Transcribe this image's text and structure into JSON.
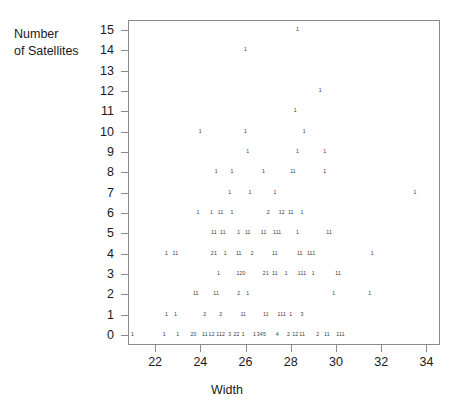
{
  "figure": {
    "background": "#ffffff",
    "frame_color": "#8c8c8c",
    "text_color": "#1a1a1a",
    "mark_color": "#3a3a3a"
  },
  "axes": {
    "ylabel_line1": "Number",
    "ylabel_line2": "of Satellites",
    "xlabel": "Width",
    "ytick_labels": [
      "15",
      "14",
      "13",
      "12",
      "11",
      "10",
      "9",
      "8",
      "7",
      "6",
      "5",
      "4",
      "3",
      "2",
      "1",
      "0"
    ],
    "xtick_labels": [
      "22",
      "24",
      "26",
      "28",
      "30",
      "32",
      "34"
    ]
  },
  "caption": "",
  "chart_data": {
    "type": "scatter",
    "title": "",
    "xlabel": "Width",
    "ylabel": "Number of Satellites",
    "xlim": [
      20.8,
      34.6
    ],
    "ylim": [
      -0.5,
      15.5
    ],
    "xticks": [
      22,
      24,
      26,
      28,
      30,
      32,
      34
    ],
    "yticks": [
      0,
      1,
      2,
      3,
      4,
      5,
      6,
      7,
      8,
      9,
      10,
      11,
      12,
      13,
      14,
      15
    ],
    "grid": false,
    "legend": null,
    "note": "Counts plotted as small digit glyphs; each glyph shows how many observations share that (width, satellites) location.",
    "points": [
      {
        "x": 28.3,
        "y": 15,
        "label": "1"
      },
      {
        "x": 26.0,
        "y": 14,
        "label": "1"
      },
      {
        "x": 29.3,
        "y": 12,
        "label": "1"
      },
      {
        "x": 28.2,
        "y": 11,
        "label": "1"
      },
      {
        "x": 24.0,
        "y": 10,
        "label": "1"
      },
      {
        "x": 26.0,
        "y": 10,
        "label": "1"
      },
      {
        "x": 28.6,
        "y": 10,
        "label": "1"
      },
      {
        "x": 26.1,
        "y": 9,
        "label": "1"
      },
      {
        "x": 28.3,
        "y": 9,
        "label": "1"
      },
      {
        "x": 29.5,
        "y": 9,
        "label": "1"
      },
      {
        "x": 24.7,
        "y": 8,
        "label": "1"
      },
      {
        "x": 25.4,
        "y": 8,
        "label": "1"
      },
      {
        "x": 26.8,
        "y": 8,
        "label": "1"
      },
      {
        "x": 28.1,
        "y": 8,
        "label": "11"
      },
      {
        "x": 29.5,
        "y": 8,
        "label": "1"
      },
      {
        "x": 25.3,
        "y": 7,
        "label": "1"
      },
      {
        "x": 26.2,
        "y": 7,
        "label": "1"
      },
      {
        "x": 27.3,
        "y": 7,
        "label": "1"
      },
      {
        "x": 33.5,
        "y": 7,
        "label": "1"
      },
      {
        "x": 23.9,
        "y": 6,
        "label": "1"
      },
      {
        "x": 24.5,
        "y": 6,
        "label": "1"
      },
      {
        "x": 24.9,
        "y": 6,
        "label": "11"
      },
      {
        "x": 25.4,
        "y": 6,
        "label": "1"
      },
      {
        "x": 27.0,
        "y": 6,
        "label": "2"
      },
      {
        "x": 27.6,
        "y": 6,
        "label": "12"
      },
      {
        "x": 28.0,
        "y": 6,
        "label": "11"
      },
      {
        "x": 28.5,
        "y": 6,
        "label": "1"
      },
      {
        "x": 24.6,
        "y": 5,
        "label": "11"
      },
      {
        "x": 25.0,
        "y": 5,
        "label": "11"
      },
      {
        "x": 25.7,
        "y": 5,
        "label": "1"
      },
      {
        "x": 26.1,
        "y": 5,
        "label": "11"
      },
      {
        "x": 26.8,
        "y": 5,
        "label": "11"
      },
      {
        "x": 27.4,
        "y": 5,
        "label": "111"
      },
      {
        "x": 28.3,
        "y": 5,
        "label": "1"
      },
      {
        "x": 29.7,
        "y": 5,
        "label": "11"
      },
      {
        "x": 22.5,
        "y": 4,
        "label": "1"
      },
      {
        "x": 22.9,
        "y": 4,
        "label": "11"
      },
      {
        "x": 24.6,
        "y": 4,
        "label": "21"
      },
      {
        "x": 25.1,
        "y": 4,
        "label": "1"
      },
      {
        "x": 25.7,
        "y": 4,
        "label": "11"
      },
      {
        "x": 26.3,
        "y": 4,
        "label": "2"
      },
      {
        "x": 27.3,
        "y": 4,
        "label": "11"
      },
      {
        "x": 28.4,
        "y": 4,
        "label": "11"
      },
      {
        "x": 28.9,
        "y": 4,
        "label": "111"
      },
      {
        "x": 31.6,
        "y": 4,
        "label": "1"
      },
      {
        "x": 24.8,
        "y": 3,
        "label": "1"
      },
      {
        "x": 25.8,
        "y": 3,
        "label": "120"
      },
      {
        "x": 26.9,
        "y": 3,
        "label": "21"
      },
      {
        "x": 27.3,
        "y": 3,
        "label": "11"
      },
      {
        "x": 27.8,
        "y": 3,
        "label": "1"
      },
      {
        "x": 28.5,
        "y": 3,
        "label": "111"
      },
      {
        "x": 29.0,
        "y": 3,
        "label": "1"
      },
      {
        "x": 30.1,
        "y": 3,
        "label": "11"
      },
      {
        "x": 23.8,
        "y": 2,
        "label": "11"
      },
      {
        "x": 24.7,
        "y": 2,
        "label": "11"
      },
      {
        "x": 25.7,
        "y": 2,
        "label": "2"
      },
      {
        "x": 26.1,
        "y": 2,
        "label": "1"
      },
      {
        "x": 29.9,
        "y": 2,
        "label": "1"
      },
      {
        "x": 31.5,
        "y": 2,
        "label": "1"
      },
      {
        "x": 22.5,
        "y": 1,
        "label": "1"
      },
      {
        "x": 22.9,
        "y": 1,
        "label": "1"
      },
      {
        "x": 24.2,
        "y": 1,
        "label": "2"
      },
      {
        "x": 24.9,
        "y": 1,
        "label": "2"
      },
      {
        "x": 25.9,
        "y": 1,
        "label": "11"
      },
      {
        "x": 26.9,
        "y": 1,
        "label": "11"
      },
      {
        "x": 27.6,
        "y": 1,
        "label": "111"
      },
      {
        "x": 28.0,
        "y": 1,
        "label": "1"
      },
      {
        "x": 28.5,
        "y": 1,
        "label": "3"
      },
      {
        "x": 21.0,
        "y": 0,
        "label": "1"
      },
      {
        "x": 22.4,
        "y": 0,
        "label": "1"
      },
      {
        "x": 23.0,
        "y": 0,
        "label": "1"
      },
      {
        "x": 23.7,
        "y": 0,
        "label": "20"
      },
      {
        "x": 24.2,
        "y": 0,
        "label": "11"
      },
      {
        "x": 24.5,
        "y": 0,
        "label": "12"
      },
      {
        "x": 24.9,
        "y": 0,
        "label": "112"
      },
      {
        "x": 25.3,
        "y": 0,
        "label": "3"
      },
      {
        "x": 25.6,
        "y": 0,
        "label": "22"
      },
      {
        "x": 25.9,
        "y": 0,
        "label": "1"
      },
      {
        "x": 26.4,
        "y": 0,
        "label": "1"
      },
      {
        "x": 26.7,
        "y": 0,
        "label": "345"
      },
      {
        "x": 27.4,
        "y": 0,
        "label": "4"
      },
      {
        "x": 27.9,
        "y": 0,
        "label": "2"
      },
      {
        "x": 28.2,
        "y": 0,
        "label": "12"
      },
      {
        "x": 28.5,
        "y": 0,
        "label": "11"
      },
      {
        "x": 29.2,
        "y": 0,
        "label": "2"
      },
      {
        "x": 29.6,
        "y": 0,
        "label": "11"
      },
      {
        "x": 30.2,
        "y": 0,
        "label": "111"
      }
    ]
  }
}
